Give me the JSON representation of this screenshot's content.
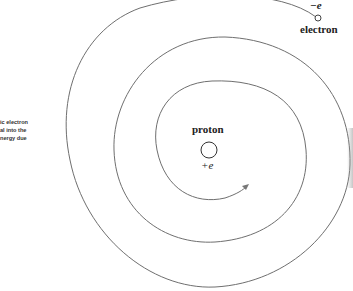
{
  "caption": {
    "lines": [
      "ic electron",
      "al into the",
      "nergy due"
    ]
  },
  "labels": {
    "electron_charge": "−e",
    "electron": "electron",
    "proton": "proton",
    "proton_charge": "+e"
  },
  "colors": {
    "line": "#6f6f6f",
    "text": "#222222",
    "background": "#ffffff"
  },
  "icons": {
    "electron": "small-circle",
    "proton": "circle",
    "arrowhead": "arrow"
  }
}
